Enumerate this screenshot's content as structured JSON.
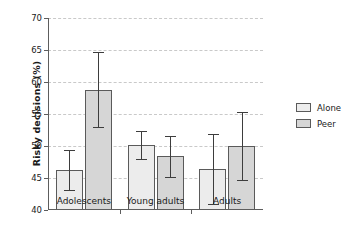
{
  "chart_data": {
    "type": "bar",
    "title": "",
    "xlabel": "",
    "ylabel": "Risky decisions (%)",
    "ylim": [
      40,
      70
    ],
    "yticks": [
      40,
      45,
      50,
      55,
      60,
      65,
      70
    ],
    "ytick_labels": [
      "40",
      "45",
      "50",
      "55",
      "60",
      "65",
      "70"
    ],
    "grid": true,
    "grid_axis": "y",
    "legend_position": "right",
    "categories": [
      "Adolescents",
      "Young adults",
      "Adults"
    ],
    "series": [
      {
        "name": "Alone",
        "color": "#ececec",
        "values": [
          46.2,
          50.2,
          46.4
        ],
        "errors_low": [
          43.1,
          48.0,
          40.9
        ],
        "errors_high": [
          49.4,
          52.4,
          51.8
        ]
      },
      {
        "name": "Peer",
        "color": "#d6d6d6",
        "values": [
          58.8,
          48.5,
          50.0
        ],
        "errors_low": [
          53.0,
          45.2,
          44.7
        ],
        "errors_high": [
          64.7,
          51.6,
          55.3
        ]
      }
    ]
  },
  "legend": {
    "items": [
      {
        "label": "Alone",
        "color": "#ececec"
      },
      {
        "label": "Peer",
        "color": "#d6d6d6"
      }
    ]
  },
  "colors": {
    "axis": "#5d5d5d",
    "grid": "#c9c9c9",
    "error": "#3d3d3d",
    "bar_edge": "#5a5a5a",
    "background": "#ffffff"
  }
}
